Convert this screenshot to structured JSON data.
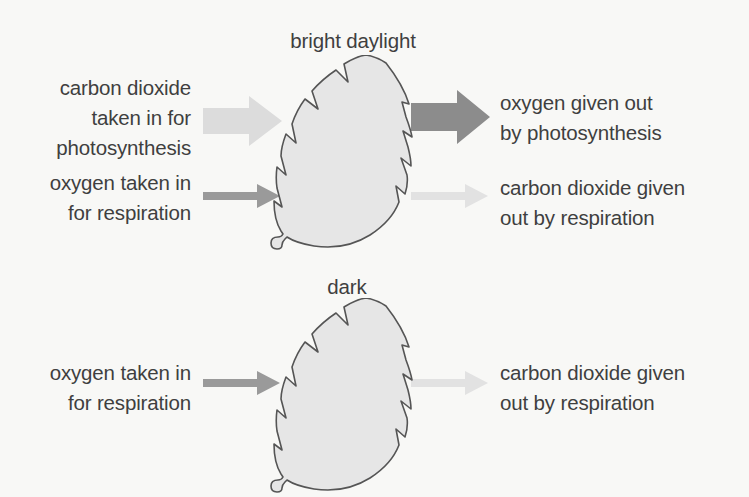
{
  "diagram": {
    "background_color": "#f8f8f6",
    "text_color": "#3f3f3f",
    "sections": [
      {
        "id": "daylight",
        "heading": "bright daylight",
        "leaf": {
          "name": "leaf-daylight",
          "fill_color": "#e6e6e6",
          "stroke_color": "#555555"
        },
        "inputs": [
          {
            "label": "carbon dioxide\ntaken in for\nphotosynthesis",
            "arrow": {
              "style": "thick",
              "color": "#dcdcdc",
              "direction": "right"
            }
          },
          {
            "label": "oxygen taken in\nfor respiration",
            "arrow": {
              "style": "thin",
              "color": "#9a9a9a",
              "direction": "right"
            }
          }
        ],
        "outputs": [
          {
            "label": "oxygen given out\nby photosynthesis",
            "arrow": {
              "style": "thick",
              "color": "#8c8c8c",
              "direction": "right"
            }
          },
          {
            "label": "carbon dioxide given\nout by respiration",
            "arrow": {
              "style": "thin",
              "color": "#e2e2e2",
              "direction": "right"
            }
          }
        ]
      },
      {
        "id": "dark",
        "heading": "dark",
        "leaf": {
          "name": "leaf-dark",
          "fill_color": "#e6e6e6",
          "stroke_color": "#555555"
        },
        "inputs": [
          {
            "label": "oxygen taken in\nfor respiration",
            "arrow": {
              "style": "thin",
              "color": "#9a9a9a",
              "direction": "right"
            }
          }
        ],
        "outputs": [
          {
            "label": "carbon dioxide given\nout by respiration",
            "arrow": {
              "style": "thin",
              "color": "#e2e2e2",
              "direction": "right"
            }
          }
        ]
      }
    ]
  },
  "labels": {
    "bright_daylight": "bright daylight",
    "dark": "dark",
    "co2_in": "carbon dioxide\ntaken in for\nphotosynthesis",
    "o2_in_top": "oxygen taken in\nfor respiration",
    "o2_out": "oxygen given out\nby photosynthesis",
    "co2_out_top": "carbon dioxide given\nout by respiration",
    "o2_in_bottom": "oxygen taken in\nfor respiration",
    "co2_out_bottom": "carbon dioxide given\nout by respiration"
  },
  "colors": {
    "background": "#f8f8f6",
    "text": "#3f3f3f",
    "leaf_fill": "#e6e6e6",
    "leaf_stroke": "#555555",
    "arrow_co2_in": "#dcdcdc",
    "arrow_o2_out": "#8c8c8c",
    "arrow_o2_in": "#9a9a9a",
    "arrow_co2_out": "#e2e2e2"
  }
}
